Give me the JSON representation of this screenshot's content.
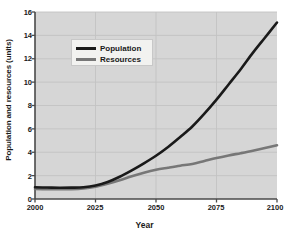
{
  "chart_data": {
    "type": "line",
    "title": "",
    "xlabel": "Year",
    "ylabel": "Population and resources (units)",
    "xlim": [
      2000,
      2100
    ],
    "ylim": [
      0,
      16
    ],
    "grid": true,
    "legend_position": "upper-left-inside",
    "xticks": [
      "2000",
      "2025",
      "2050",
      "2075",
      "2100"
    ],
    "yticks": [
      "0",
      "2",
      "4",
      "6",
      "8",
      "10",
      "12",
      "14",
      "16"
    ],
    "x": [
      2000,
      2005,
      2010,
      2015,
      2020,
      2025,
      2030,
      2035,
      2040,
      2045,
      2050,
      2055,
      2060,
      2065,
      2070,
      2075,
      2080,
      2085,
      2090,
      2095,
      2100
    ],
    "series": [
      {
        "name": "Population",
        "color": "#1a1a1a",
        "values": [
          1.0,
          0.98,
          0.96,
          0.97,
          1.0,
          1.15,
          1.45,
          1.9,
          2.45,
          3.05,
          3.7,
          4.45,
          5.3,
          6.2,
          7.3,
          8.5,
          9.8,
          11.1,
          12.5,
          13.8,
          15.1
        ]
      },
      {
        "name": "Resources",
        "color": "#777777",
        "values": [
          0.85,
          0.84,
          0.83,
          0.84,
          0.9,
          1.05,
          1.3,
          1.6,
          1.95,
          2.25,
          2.5,
          2.68,
          2.85,
          3.0,
          3.25,
          3.5,
          3.72,
          3.92,
          4.13,
          4.36,
          4.6
        ]
      }
    ],
    "colors": {
      "population": "#1a1a1a",
      "resources": "#777777",
      "plot_background": "#d6d6d6",
      "gridline": "#c3c3c3",
      "axis": "#4a4a4a",
      "page_background": "#ffffff",
      "legend_background": "#f2f2f0"
    }
  },
  "legend": {
    "items": [
      {
        "label": "Population"
      },
      {
        "label": "Resources"
      }
    ]
  }
}
